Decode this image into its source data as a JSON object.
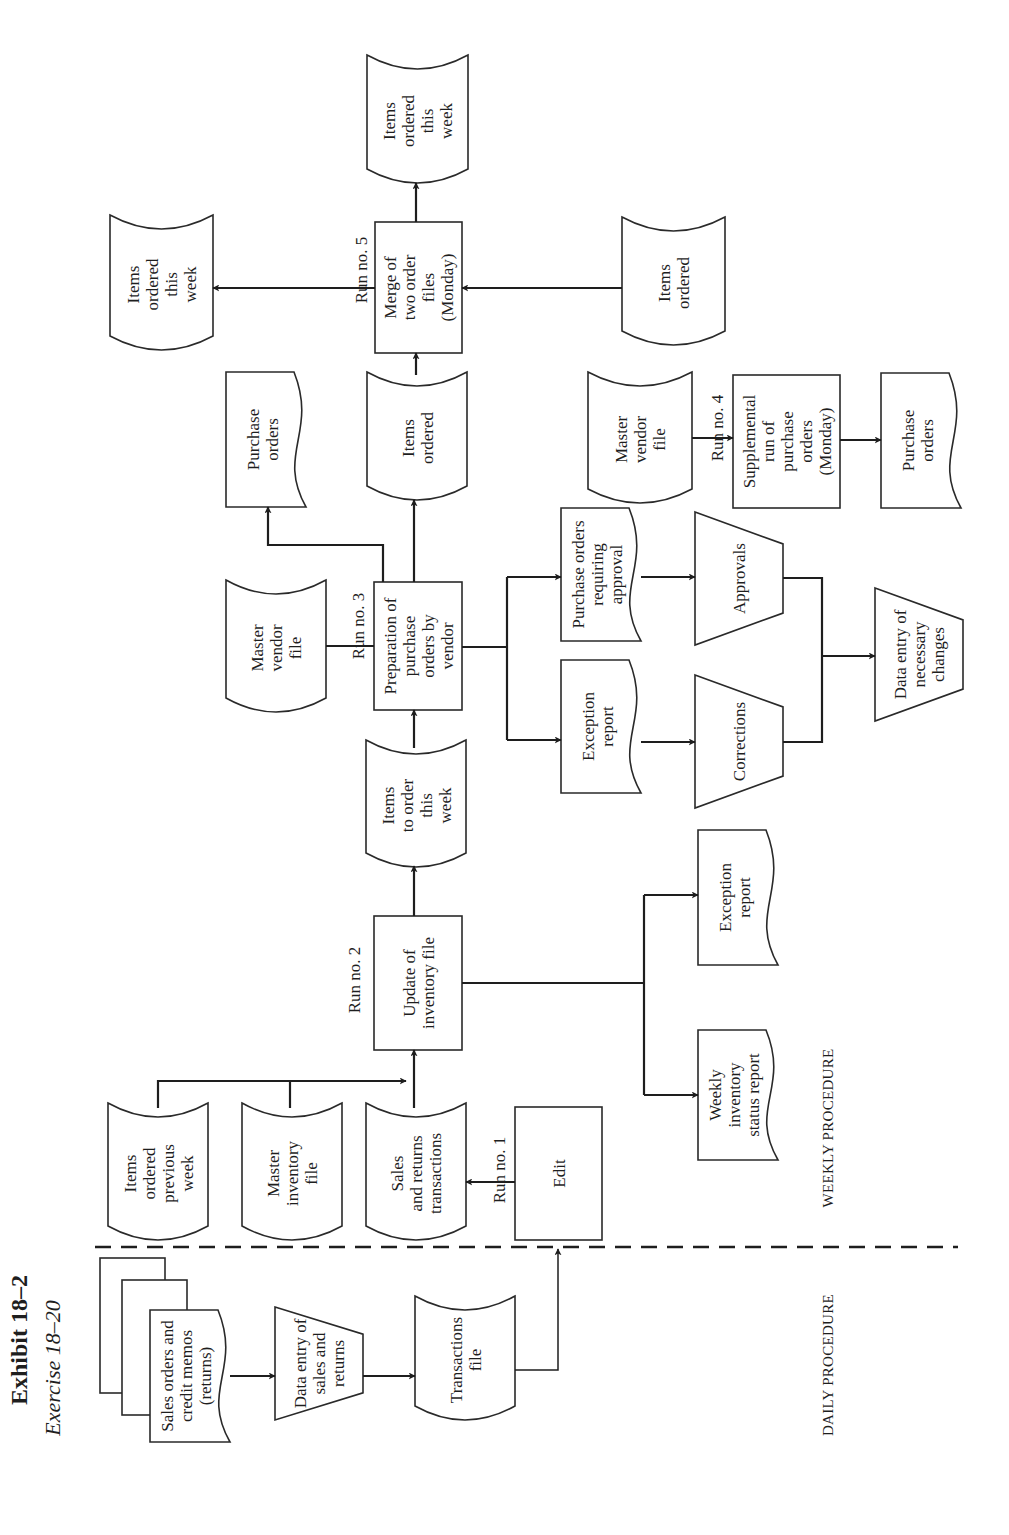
{
  "exhibit": {
    "title": "Exhibit 18–2",
    "subtitle": "Exercise 18–20"
  },
  "sections": {
    "daily": "DAILY PROCEDURE",
    "weekly": "WEEKLY PROCEDURE"
  },
  "runs": {
    "run1": "Run no. 1",
    "run2": "Run no. 2",
    "run3": "Run no. 3",
    "run4": "Run no. 4",
    "run5": "Run no. 5"
  },
  "nodes": [
    {
      "id": "sales-orders-doc",
      "type": "document-stack",
      "lines": [
        "Sales orders and",
        "credit memos",
        "(returns)"
      ]
    },
    {
      "id": "data-entry-sales",
      "type": "manual-input",
      "lines": [
        "Data entry of",
        "sales  and",
        "returns"
      ]
    },
    {
      "id": "transactions-file",
      "type": "storage",
      "lines": [
        "Transactions",
        "file"
      ]
    },
    {
      "id": "edit",
      "type": "process",
      "lines": [
        "Edit"
      ]
    },
    {
      "id": "sales-returns-transactions",
      "type": "storage",
      "lines": [
        "Sales",
        "and returns",
        "transactions"
      ]
    },
    {
      "id": "master-inventory-file",
      "type": "storage",
      "lines": [
        "Master",
        "inventory",
        "file"
      ]
    },
    {
      "id": "items-ordered-previous-week",
      "type": "storage",
      "lines": [
        "Items",
        "ordered",
        "previous",
        "week"
      ]
    },
    {
      "id": "update-inventory",
      "type": "process",
      "lines": [
        "Update of",
        "inventory file"
      ]
    },
    {
      "id": "weekly-inventory-status-report",
      "type": "document",
      "lines": [
        "Weekly",
        "inventory",
        "status report"
      ]
    },
    {
      "id": "exception-report-1",
      "type": "document",
      "lines": [
        "Exception",
        "report"
      ]
    },
    {
      "id": "items-to-order-this-week",
      "type": "storage",
      "lines": [
        "Items",
        "to order",
        "this",
        "week"
      ]
    },
    {
      "id": "prep-purchase-orders",
      "type": "process",
      "lines": [
        "Preparation of",
        "purchase",
        "orders by",
        "vendor"
      ]
    },
    {
      "id": "master-vendor-file-1",
      "type": "storage",
      "lines": [
        "Master",
        "vendor",
        "file"
      ]
    },
    {
      "id": "exception-report-2",
      "type": "document",
      "lines": [
        "Exception",
        "report"
      ]
    },
    {
      "id": "po-requiring-approval",
      "type": "document",
      "lines": [
        "Purchase orders",
        "requiring",
        "approval"
      ]
    },
    {
      "id": "corrections",
      "type": "manual-input",
      "lines": [
        "Corrections"
      ]
    },
    {
      "id": "approvals",
      "type": "manual-input",
      "lines": [
        "Approvals"
      ]
    },
    {
      "id": "data-entry-changes",
      "type": "manual-input",
      "lines": [
        "Data entry of",
        "necessary",
        "changes"
      ]
    },
    {
      "id": "purchase-orders-1",
      "type": "document",
      "lines": [
        "Purchase",
        "orders"
      ]
    },
    {
      "id": "items-ordered-1",
      "type": "storage",
      "lines": [
        "Items",
        "ordered"
      ]
    },
    {
      "id": "master-vendor-file-2",
      "type": "storage",
      "lines": [
        "Master",
        "vendor",
        "file"
      ]
    },
    {
      "id": "supplemental-run",
      "type": "process",
      "lines": [
        "Supplemental",
        "run of",
        "purchase",
        "orders",
        "(Monday)"
      ]
    },
    {
      "id": "purchase-orders-2",
      "type": "document",
      "lines": [
        "Purchase",
        "orders"
      ]
    },
    {
      "id": "merge-order-files",
      "type": "process",
      "lines": [
        "Merge of",
        "two order",
        "files",
        "(Monday)"
      ]
    },
    {
      "id": "items-ordered-2",
      "type": "storage",
      "lines": [
        "Items",
        "ordered"
      ]
    },
    {
      "id": "items-ordered-this-week-1",
      "type": "storage",
      "lines": [
        "Items",
        "ordered",
        "this",
        "week"
      ]
    },
    {
      "id": "items-ordered-this-week-2",
      "type": "storage",
      "lines": [
        "Items",
        "ordered",
        "this",
        "week"
      ]
    }
  ],
  "colors": {
    "ink": "#1e1e1e",
    "paper": "#ffffff"
  }
}
